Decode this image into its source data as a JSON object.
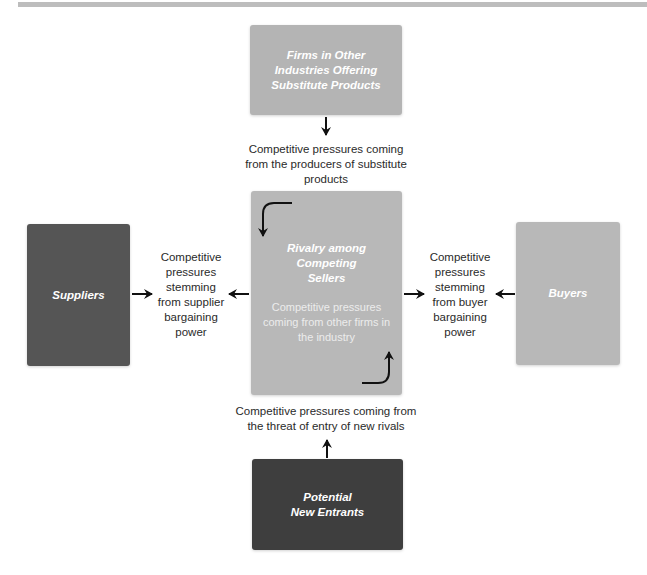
{
  "diagram": {
    "type": "five-forces-model",
    "colors": {
      "top_box": "#b4b4b4",
      "center_box": "#b8b8b8",
      "suppliers_box": "#555555",
      "buyers_box": "#b8b8b8",
      "entrants_box": "#3e3e3e",
      "arrow": "#111111",
      "label_text": "#2a2a2a"
    },
    "boxes": {
      "substitutes": {
        "title": "Firms in Other\nIndustries Offering\nSubstitute Products"
      },
      "rivalry": {
        "title": "Rivalry among\nCompeting\nSellers",
        "subtitle": "Competitive pressures\ncoming from other firms in\nthe industry"
      },
      "suppliers": {
        "title": "Suppliers"
      },
      "buyers": {
        "title": "Buyers"
      },
      "new_entrants": {
        "title": "Potential\nNew Entrants"
      }
    },
    "labels": {
      "substitutes": "Competitive pressures coming\nfrom the producers of substitute\nproducts",
      "suppliers": "Competitive\npressures\nstemming\nfrom supplier\nbargaining\npower",
      "buyers": "Competitive\npressures\nstemming\nfrom buyer\nbargaining\npower",
      "new_entrants": "Competitive pressures coming from\nthe threat of entry of new rivals"
    }
  }
}
